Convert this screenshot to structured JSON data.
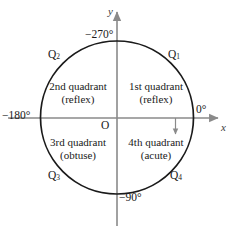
{
  "figure": {
    "axes": {
      "x_label": "x",
      "y_label": "y",
      "origin_label": "O"
    },
    "angle_marks": [
      {
        "name": "right",
        "text": "0°"
      },
      {
        "name": "top",
        "text": "−270°"
      },
      {
        "name": "left",
        "text": "−180°"
      },
      {
        "name": "bottom",
        "text": "−90°"
      }
    ],
    "quadrant_tags": [
      {
        "name": "q1",
        "letter": "Q",
        "index": "1"
      },
      {
        "name": "q2",
        "letter": "Q",
        "index": "2"
      },
      {
        "name": "q3",
        "letter": "Q",
        "index": "3"
      },
      {
        "name": "q4",
        "letter": "Q",
        "index": "4"
      }
    ],
    "quadrants": [
      {
        "name": "first",
        "title": "1st quadrant",
        "subtitle": "(reflex)"
      },
      {
        "name": "second",
        "title": "2nd quadrant",
        "subtitle": "(reflex)"
      },
      {
        "name": "third",
        "title": "3rd quadrant",
        "subtitle": "(obtuse)"
      },
      {
        "name": "fourth",
        "title": "4th quadrant",
        "subtitle": "(acute)"
      }
    ],
    "colors": {
      "circle": "#1a1a1a",
      "axis": "#8a8a8a",
      "text": "#1a1a1a",
      "background": "#ffffff",
      "direction_arrow": "#8a8a8a"
    }
  }
}
